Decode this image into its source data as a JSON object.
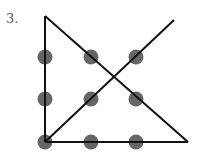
{
  "problem": {
    "number_label": "3.",
    "description": "Nine-dot puzzle solution: 3x3 grid of dots connected by four straight lines",
    "dot_color": "#666666",
    "line_color": "#111111",
    "dots": [
      {
        "x": 45,
        "y": 57
      },
      {
        "x": 91,
        "y": 57
      },
      {
        "x": 136,
        "y": 57
      },
      {
        "x": 45,
        "y": 99
      },
      {
        "x": 91,
        "y": 99
      },
      {
        "x": 136,
        "y": 99
      },
      {
        "x": 45,
        "y": 142
      },
      {
        "x": 91,
        "y": 142
      },
      {
        "x": 136,
        "y": 142
      }
    ],
    "lines": [
      {
        "x1": 45,
        "y1": 16,
        "x2": 45,
        "y2": 142
      },
      {
        "x1": 45,
        "y1": 16,
        "x2": 188,
        "y2": 142
      },
      {
        "x1": 45,
        "y1": 142,
        "x2": 188,
        "y2": 142
      },
      {
        "x1": 45,
        "y1": 142,
        "x2": 174,
        "y2": 20
      }
    ]
  }
}
